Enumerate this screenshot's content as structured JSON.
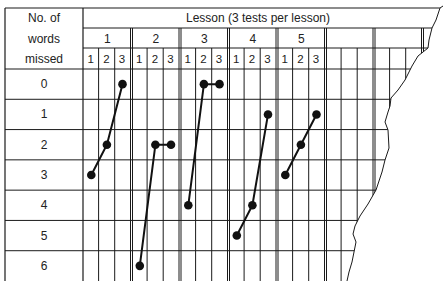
{
  "chart_data": {
    "type": "line",
    "title": "Lesson (3 tests per lesson)",
    "row_header": [
      "No. of",
      "words",
      "missed"
    ],
    "ylabel": "No. of words missed",
    "xlabel": "Lesson (3 tests per lesson)",
    "y_categories": [
      "0",
      "1",
      "2",
      "3",
      "4",
      "5",
      "6"
    ],
    "ylim": [
      0,
      6
    ],
    "y_inverted": true,
    "lessons": [
      "1",
      "2",
      "3",
      "4",
      "5"
    ],
    "tests_per_lesson": [
      "1",
      "2",
      "3"
    ],
    "grid": true,
    "series": [
      {
        "name": "Lesson 1",
        "values": [
          3,
          2,
          0
        ]
      },
      {
        "name": "Lesson 2",
        "values": [
          6,
          2,
          2
        ]
      },
      {
        "name": "Lesson 3",
        "values": [
          4,
          0,
          0
        ]
      },
      {
        "name": "Lesson 4",
        "values": [
          5,
          4,
          1
        ]
      },
      {
        "name": "Lesson 5",
        "values": [
          3,
          2,
          1
        ]
      }
    ],
    "empty_lesson_columns": 2,
    "right_edge": "torn"
  },
  "colors": {
    "grid": "#1a1a1a",
    "line": "#111111",
    "marker": "#111111",
    "background": "#ffffff"
  }
}
